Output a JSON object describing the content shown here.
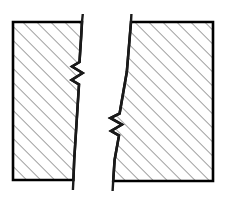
{
  "figure": {
    "type": "engineering-section-drawing",
    "background_color": "#ffffff",
    "canvas": {
      "width": 228,
      "height": 199
    },
    "outline_color": "#000000",
    "outline_width": 2.6,
    "break_line_color": "#1a1a1a",
    "break_line_width": 2.4,
    "hatch": {
      "color": "#2b2b2b",
      "angle_degrees": 45,
      "direction": "lower-left-to-upper-right",
      "spacing_px": 7,
      "line_width": 0.9
    },
    "shapes": [
      {
        "name": "left-section-block",
        "label": "Left hatched section",
        "hatched": true,
        "outline_points": "13,22 82,22 81.2,36 79.5,62 72.0,66.5 82.6,73.0 71.6,80.0 79.0,84.5 74.2,160 73.4,180 13,180",
        "top_edge_y": 22,
        "bottom_edge_y": 180,
        "left_edge_x": 13
      },
      {
        "name": "right-section-block",
        "label": "Right hatched section",
        "hatched": true,
        "outline_points": "131,22 213,22 213,181 113.2,181 114.6,160 119.0,135.5 111.0,131.0 122.0,124.5 110.4,118.0 119.6,113.5 126.8,72 131,22",
        "top_edge_y": 22,
        "bottom_edge_y": 181,
        "right_edge_x": 213
      }
    ],
    "break_lines": [
      {
        "name": "left-break-line",
        "label": "Left conventional break line",
        "points": "82.8,14 82.0,22 81.2,36 79.5,62 72.0,66.5 82.6,73.0 71.6,80.0 79.0,84.5 74.2,160 73.4,180 72.9,190",
        "extends_above_top": true,
        "extends_below_bottom": true,
        "zigzag_center_y": 75
      },
      {
        "name": "right-break-line",
        "label": "Right conventional break line",
        "points": "131.4,14 131.0,22 126.8,72 119.6,113.5 110.4,118.0 122.0,124.5 111.0,131.0 119.0,135.5 114.6,160 113.2,181 112.6,191",
        "extends_above_top": true,
        "extends_below_bottom": true,
        "zigzag_center_y": 125
      }
    ]
  }
}
